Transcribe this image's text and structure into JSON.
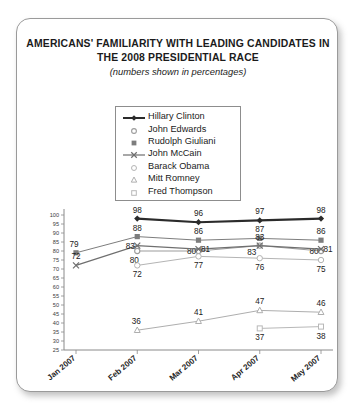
{
  "card": {
    "title_line1": "AMERICANS' FAMILIARITY WITH LEADING CANDIDATES IN",
    "title_line2": "THE 2008 PRESIDENTIAL RACE",
    "subtitle": "(numbers shown in percentages)"
  },
  "legend": {
    "items": [
      {
        "label": "Hillary Clinton",
        "marker": "diamond-filled",
        "color": "#2b2b2b"
      },
      {
        "label": "John Edwards",
        "marker": "circle-open",
        "color": "#9b9b9b"
      },
      {
        "label": "Rudolph Giuliani",
        "marker": "square-filled",
        "color": "#7d7d7d"
      },
      {
        "label": "John McCain",
        "marker": "x-cross",
        "color": "#6f6f6f"
      },
      {
        "label": "Barack Obama",
        "marker": "circle-hollow",
        "color": "#b4b4b4"
      },
      {
        "label": "Mitt Romney",
        "marker": "triangle-open",
        "color": "#aeaeae"
      },
      {
        "label": "Fred Thompson",
        "marker": "square-open",
        "color": "#b8b8b8"
      }
    ]
  },
  "chart_data": {
    "type": "line",
    "title": "AMERICANS' FAMILIARITY WITH LEADING CANDIDATES IN THE 2008 PRESIDENTIAL RACE",
    "subtitle": "(numbers shown in percentages)",
    "xlabel": "",
    "ylabel": "",
    "categories": [
      "Jan 2007",
      "Feb 2007",
      "Mar 2007",
      "Apr 2007",
      "May 2007"
    ],
    "ylim": [
      25,
      100
    ],
    "ytick_step": 5,
    "yticks": [
      25,
      30,
      35,
      40,
      45,
      50,
      55,
      60,
      65,
      70,
      75,
      80,
      85,
      90,
      95,
      100
    ],
    "grid": false,
    "legend_position": "top-center",
    "data_labels": true,
    "series": [
      {
        "name": "Hillary Clinton",
        "marker": "diamond-filled",
        "color": "#2b2b2b",
        "linewidth": 2.1,
        "values": [
          null,
          98,
          96,
          97,
          98
        ]
      },
      {
        "name": "John Edwards",
        "marker": "circle-open",
        "color": "#9b9b9b",
        "linewidth": 1,
        "values": [
          null,
          80,
          80,
          83,
          80
        ]
      },
      {
        "name": "Rudolph Giuliani",
        "marker": "square-filled",
        "color": "#7d7d7d",
        "linewidth": 1,
        "values": [
          79,
          88,
          86,
          87,
          86
        ]
      },
      {
        "name": "John McCain",
        "marker": "x-cross",
        "color": "#6f6f6f",
        "linewidth": 1.3,
        "values": [
          72,
          83,
          81,
          83,
          81
        ]
      },
      {
        "name": "Barack Obama",
        "marker": "circle-hollow",
        "color": "#b4b4b4",
        "linewidth": 1,
        "values": [
          null,
          72,
          77,
          76,
          75
        ]
      },
      {
        "name": "Mitt Romney",
        "marker": "triangle-open",
        "color": "#aeaeae",
        "linewidth": 1,
        "values": [
          null,
          36,
          41,
          47,
          46
        ]
      },
      {
        "name": "Fred Thompson",
        "marker": "square-open",
        "color": "#b8b8b8",
        "linewidth": 1,
        "values": [
          null,
          null,
          null,
          37,
          38
        ]
      }
    ],
    "label_offsets": {
      "Hillary Clinton": [
        null,
        "above",
        "above",
        "above",
        "above"
      ],
      "Rudolph Giuliani": [
        "left-above",
        "above",
        "above",
        "above",
        "above"
      ],
      "John McCain": [
        null,
        "left",
        "right",
        null,
        "right"
      ],
      "John Edwards": [
        null,
        "below-left",
        "left",
        "left-below",
        "left"
      ],
      "Barack Obama": [
        null,
        "below",
        "below",
        "below",
        "below"
      ],
      "Mitt Romney": [
        null,
        "above-left",
        "above",
        "above",
        "above"
      ],
      "Fred Thompson": [
        null,
        null,
        null,
        "below",
        "below"
      ]
    }
  }
}
